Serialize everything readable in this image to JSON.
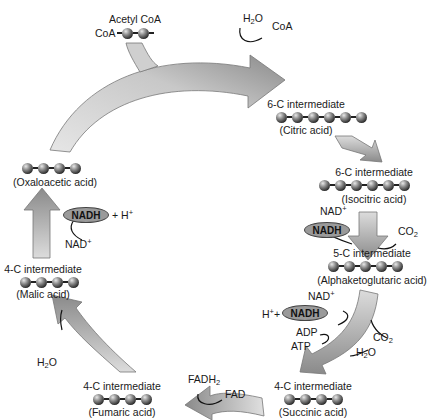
{
  "diagram": {
    "colors": {
      "arrow_light": "#d9d9d9",
      "arrow_dark": "#8c8c8c",
      "atom": "#3a3a3a",
      "nadh_fill": "#9a9a9a"
    },
    "entry": {
      "label": "Acetyl CoA",
      "coa_label": "CoA",
      "carbons": 2
    },
    "step1_cofactors": {
      "in": "H2O",
      "out": "CoA"
    },
    "intermediates": [
      {
        "id": "citric",
        "label": "6-C intermediate",
        "name": "(Citric acid)",
        "carbons": 6
      },
      {
        "id": "isocitric",
        "label": "6-C intermediate",
        "name": "(Isocitric acid)",
        "carbons": 6
      },
      {
        "id": "alphaketoglutaric",
        "label": "5-C intermediate",
        "name": "(Alphaketoglutaric acid)",
        "carbons": 5
      },
      {
        "id": "succinic",
        "label": "4-C intermediate",
        "name": "(Succinic acid)",
        "carbons": 4
      },
      {
        "id": "fumaric",
        "label": "4-C intermediate",
        "name": "(Fumaric acid)",
        "carbons": 4
      },
      {
        "id": "malic",
        "label": "4-C intermediate",
        "name": "(Malic acid)",
        "carbons": 4
      },
      {
        "id": "oxaloacetic",
        "label": "",
        "name": "(Oxaloacetic acid)",
        "carbons": 4
      }
    ],
    "cofactors": {
      "isocitric_step": {
        "nad": "NAD",
        "nadh": "NADH",
        "co2": "CO"
      },
      "akg_step": {
        "nad": "NAD",
        "h_plus": "H",
        "nadh": "NADH",
        "adp": "ADP",
        "atp": "ATP",
        "co2": "CO",
        "h2o": "H"
      },
      "succinic_step": {
        "fadh2": "FADH",
        "fad": "FAD"
      },
      "fumaric_step": {
        "h2o": "H"
      },
      "malic_step": {
        "nadh": "NADH",
        "h_plus": "+ H",
        "nad": "NAD"
      }
    },
    "sup_plus": "+",
    "sub_2": "2",
    "o_suffix": "O"
  }
}
